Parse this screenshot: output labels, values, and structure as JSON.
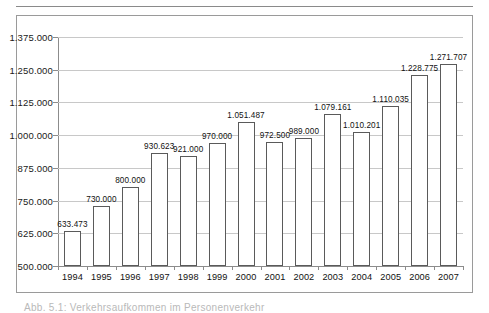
{
  "chart_data": {
    "type": "bar",
    "title": "",
    "subtitle": "",
    "xlabel": "",
    "ylabel": "",
    "categories": [
      "1994",
      "1995",
      "1996",
      "1997",
      "1998",
      "1999",
      "2000",
      "2001",
      "2002",
      "2003",
      "2004",
      "2005",
      "2006",
      "2007"
    ],
    "values": [
      633473,
      730000,
      800000,
      930623,
      921000,
      970000,
      1051487,
      972500,
      989000,
      1079161,
      1010201,
      1110035,
      1228775,
      1271707
    ],
    "value_labels": [
      "633.473",
      "730.000",
      "800.000",
      "930.623",
      "921.000",
      "970.000",
      "1.051.487",
      "972.500",
      "989.000",
      "1.079.161",
      "1.010.201",
      "1.110.035",
      "1.228.775",
      "1.271.707"
    ],
    "ylim": [
      500000,
      1375000
    ],
    "ytick_values": [
      500000,
      625000,
      750000,
      875000,
      1000000,
      1125000,
      1250000,
      1375000
    ],
    "ytick_labels": [
      "500.000",
      "625.000",
      "750.000",
      "875.000",
      "1.000.000",
      "1.125.000",
      "1.250.000",
      "1.375.000"
    ],
    "grid": "horizontal",
    "legend": "none",
    "bar_fill": "dotted-stipple-white",
    "bar_outline_color": "#5a5a5a",
    "gridline_color": "#c8c8c8",
    "axis_color": "#8c8c8c",
    "text_color": "#111111"
  },
  "frame": {
    "border_color": "#9a9a9a",
    "rule_color": "#8a8a8a"
  },
  "caption": {
    "text": "Abb. 5.1: Verkehrsaufkommen im Personenverkehr"
  }
}
